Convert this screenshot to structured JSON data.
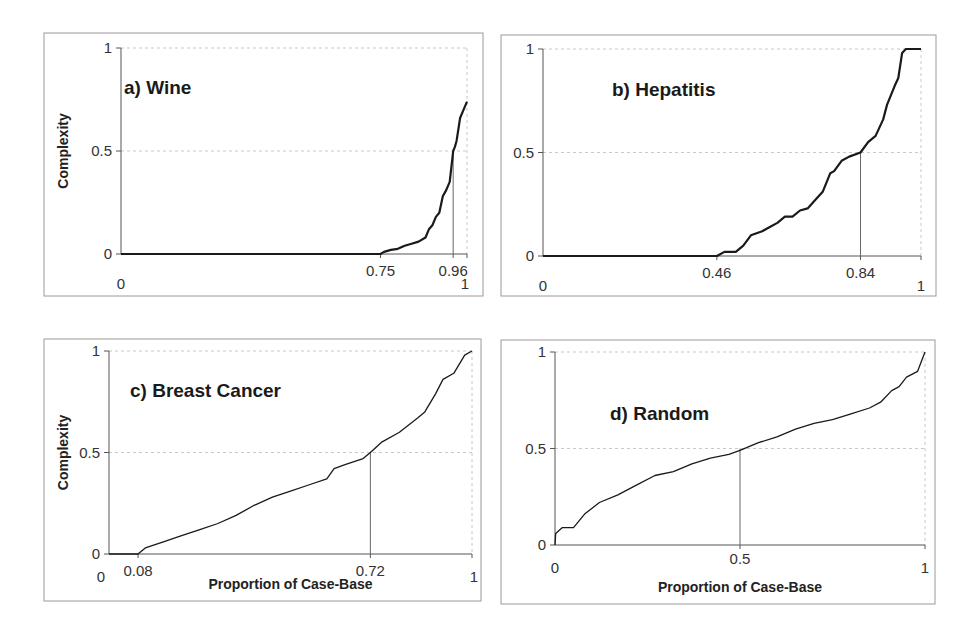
{
  "figure": {
    "colors": {
      "curve": "#1a1a1a",
      "axis": "#555555",
      "grid": "#c8c8c8",
      "frame": "#9a9a9a",
      "marker": "#666666"
    }
  },
  "chart_data": [
    {
      "type": "line",
      "panel": "a",
      "title": "a) Wine",
      "xlabel": "",
      "ylabel": "Complexity",
      "xlim": [
        0,
        1
      ],
      "ylim": [
        0,
        1
      ],
      "x_ticks": [
        "0",
        "0.75",
        "0.96",
        "1"
      ],
      "y_ticks": [
        "0",
        "0.5",
        "1"
      ],
      "grid": true,
      "marker": {
        "x": 0.96,
        "y": 0.5
      },
      "layout": {
        "frame": [
          44,
          33,
          439,
          263
        ],
        "plot": [
          121,
          48,
          467,
          254
        ],
        "stroke": 2.2,
        "title_pos": [
          124,
          94
        ]
      },
      "series": [
        {
          "name": "Wine",
          "x": [
            0,
            0.75,
            0.76,
            0.78,
            0.8,
            0.82,
            0.84,
            0.86,
            0.88,
            0.89,
            0.9,
            0.91,
            0.92,
            0.93,
            0.94,
            0.95,
            0.96,
            0.965,
            0.97,
            0.98,
            0.99,
            1.0
          ],
          "y": [
            0,
            0,
            0.01,
            0.02,
            0.025,
            0.04,
            0.05,
            0.06,
            0.08,
            0.12,
            0.14,
            0.18,
            0.2,
            0.28,
            0.31,
            0.35,
            0.5,
            0.52,
            0.55,
            0.66,
            0.7,
            0.74
          ]
        }
      ]
    },
    {
      "type": "line",
      "panel": "b",
      "title": "b) Hepatitis",
      "xlabel": "",
      "ylabel": "",
      "xlim": [
        0,
        1
      ],
      "ylim": [
        0,
        1
      ],
      "x_ticks": [
        "0",
        "0.46",
        "0.84",
        "1"
      ],
      "y_ticks": [
        "0",
        "0.5",
        "1"
      ],
      "grid": true,
      "marker": {
        "x": 0.84,
        "y": 0.5
      },
      "layout": {
        "frame": [
          501,
          35,
          435,
          261
        ],
        "plot": [
          543,
          49,
          921,
          256
        ],
        "stroke": 2.2,
        "title_pos": [
          612,
          96
        ]
      },
      "series": [
        {
          "name": "Hepatitis",
          "x": [
            0,
            0.46,
            0.48,
            0.51,
            0.53,
            0.55,
            0.58,
            0.6,
            0.62,
            0.64,
            0.66,
            0.68,
            0.7,
            0.72,
            0.74,
            0.76,
            0.77,
            0.79,
            0.81,
            0.84,
            0.86,
            0.88,
            0.9,
            0.91,
            0.93,
            0.94,
            0.95,
            0.96,
            1.0
          ],
          "y": [
            0,
            0,
            0.02,
            0.02,
            0.05,
            0.1,
            0.12,
            0.14,
            0.16,
            0.19,
            0.19,
            0.22,
            0.23,
            0.27,
            0.31,
            0.4,
            0.41,
            0.46,
            0.48,
            0.5,
            0.55,
            0.58,
            0.66,
            0.73,
            0.82,
            0.86,
            0.98,
            1.0,
            1.0
          ]
        }
      ]
    },
    {
      "type": "line",
      "panel": "c",
      "title": "c) Breast Cancer",
      "xlabel": "Proportion of Case-Base",
      "ylabel": "Complexity",
      "xlim": [
        0,
        1
      ],
      "ylim": [
        0,
        1
      ],
      "x_ticks": [
        "0",
        "0.08",
        "0.72",
        "1"
      ],
      "y_ticks": [
        "0",
        "0.5",
        "1"
      ],
      "grid": true,
      "marker": {
        "x": 0.72,
        "y": 0.5
      },
      "layout": {
        "frame": [
          44,
          339,
          437,
          262
        ],
        "plot": [
          109,
          351,
          472,
          554
        ],
        "stroke": 1.3,
        "title_pos": [
          130,
          397
        ]
      },
      "series": [
        {
          "name": "Breast Cancer",
          "x": [
            0,
            0.08,
            0.1,
            0.15,
            0.2,
            0.25,
            0.3,
            0.35,
            0.4,
            0.45,
            0.5,
            0.55,
            0.6,
            0.62,
            0.65,
            0.7,
            0.72,
            0.75,
            0.8,
            0.85,
            0.87,
            0.9,
            0.92,
            0.95,
            0.98,
            1.0
          ],
          "y": [
            0,
            0,
            0.03,
            0.06,
            0.09,
            0.12,
            0.15,
            0.19,
            0.24,
            0.28,
            0.31,
            0.34,
            0.37,
            0.42,
            0.44,
            0.47,
            0.5,
            0.55,
            0.6,
            0.67,
            0.7,
            0.79,
            0.86,
            0.89,
            0.98,
            1.0
          ]
        }
      ]
    },
    {
      "type": "line",
      "panel": "d",
      "title": "d) Random",
      "xlabel": "Proportion of Case-Base",
      "ylabel": "",
      "xlim": [
        0,
        1
      ],
      "ylim": [
        0,
        1
      ],
      "x_ticks": [
        "0",
        "0.5",
        "1"
      ],
      "y_ticks": [
        "0",
        "0.5",
        "1"
      ],
      "grid": true,
      "marker": {
        "x": 0.5,
        "y": 0.5
      },
      "layout": {
        "frame": [
          501,
          340,
          434,
          264
        ],
        "plot": [
          555,
          352,
          925,
          545
        ],
        "stroke": 1.3,
        "title_pos": [
          610,
          420
        ]
      },
      "series": [
        {
          "name": "Random",
          "x": [
            0,
            0.002,
            0.02,
            0.05,
            0.08,
            0.12,
            0.17,
            0.22,
            0.27,
            0.32,
            0.37,
            0.42,
            0.47,
            0.5,
            0.55,
            0.6,
            0.65,
            0.7,
            0.75,
            0.8,
            0.85,
            0.88,
            0.91,
            0.93,
            0.95,
            0.98,
            1.0
          ],
          "y": [
            0,
            0.06,
            0.09,
            0.09,
            0.16,
            0.22,
            0.26,
            0.31,
            0.36,
            0.38,
            0.42,
            0.45,
            0.47,
            0.49,
            0.53,
            0.56,
            0.6,
            0.63,
            0.65,
            0.68,
            0.71,
            0.74,
            0.8,
            0.82,
            0.87,
            0.9,
            1.0
          ]
        }
      ]
    }
  ]
}
